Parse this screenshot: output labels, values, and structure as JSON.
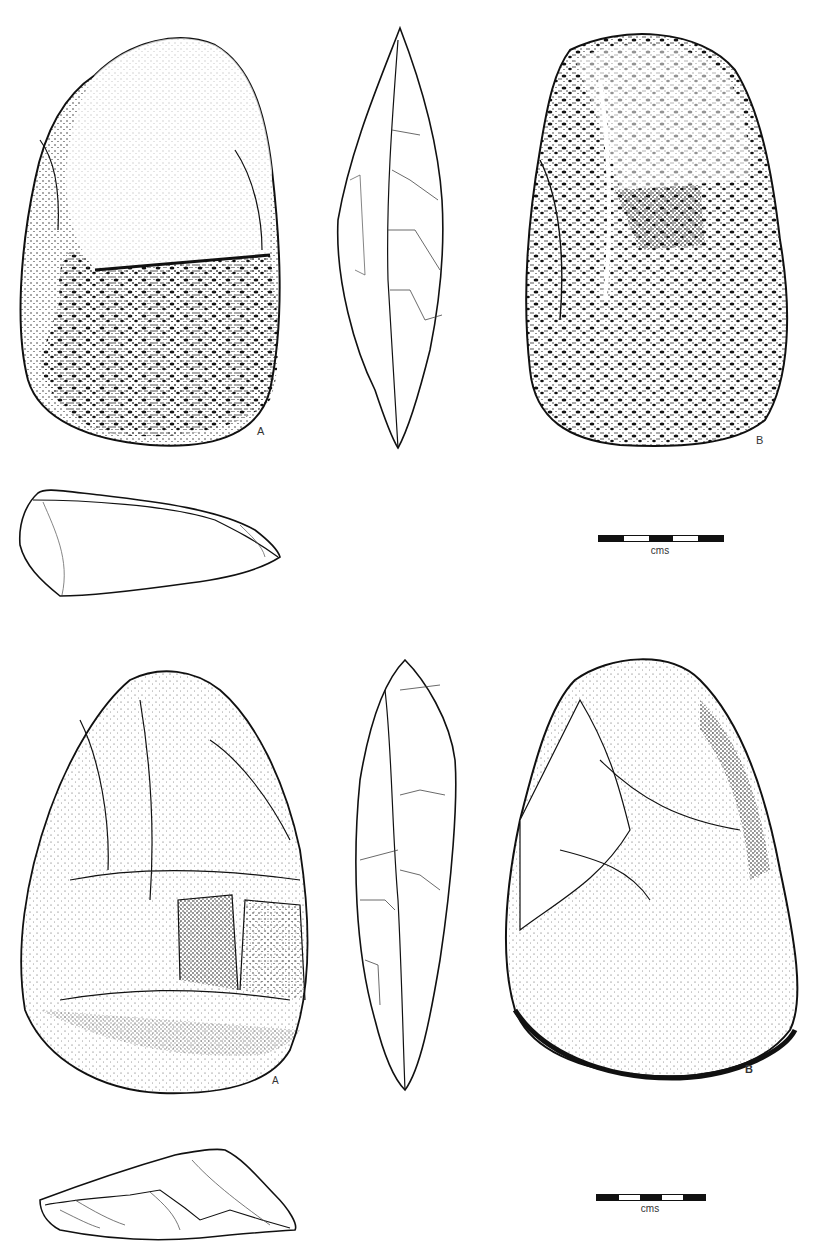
{
  "plate": {
    "description": "Archaeological illustration plate of two stone handaxes, each with views A, B, side profile and base section",
    "background": "#ffffff",
    "ink": "#111111"
  },
  "artifacts": [
    {
      "name": "upper-handaxe",
      "views": [
        {
          "id": "A",
          "label": "A",
          "kind": "face-view"
        },
        {
          "id": "side",
          "label": "",
          "kind": "side-profile"
        },
        {
          "id": "B",
          "label": "B",
          "kind": "face-view"
        },
        {
          "id": "section",
          "label": "",
          "kind": "cross-section"
        }
      ],
      "scale": {
        "unit_label": "cms",
        "segments": 5
      }
    },
    {
      "name": "lower-handaxe",
      "views": [
        {
          "id": "A",
          "label": "A",
          "kind": "face-view"
        },
        {
          "id": "side",
          "label": "",
          "kind": "side-profile"
        },
        {
          "id": "B",
          "label": "B",
          "kind": "face-view"
        },
        {
          "id": "section",
          "label": "",
          "kind": "cross-section"
        }
      ],
      "scale": {
        "unit_label": "cms",
        "segments": 5
      }
    }
  ]
}
